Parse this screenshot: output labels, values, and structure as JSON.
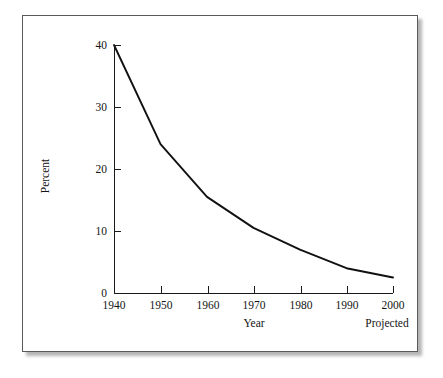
{
  "chart_data": {
    "type": "line",
    "title": "",
    "xlabel": "Year",
    "ylabel": "Percent",
    "x": [
      1940,
      1950,
      1960,
      1970,
      1980,
      1990,
      2000
    ],
    "values": [
      40,
      24,
      15.5,
      10.5,
      7,
      4,
      2.5
    ],
    "series": [
      {
        "name": "Percent",
        "values": [
          40,
          24,
          15.5,
          10.5,
          7,
          4,
          2.5
        ]
      }
    ],
    "xlim": [
      1940,
      2000
    ],
    "ylim": [
      0,
      40
    ],
    "x_ticks": [
      1940,
      1950,
      1960,
      1970,
      1980,
      1990,
      2000
    ],
    "x_tick_labels": [
      "1940",
      "1950",
      "1960",
      "1970",
      "1980",
      "1990",
      "2000"
    ],
    "y_ticks": [
      0,
      10,
      20,
      30,
      40
    ],
    "y_tick_labels": [
      "0",
      "10",
      "20",
      "30",
      "40"
    ],
    "grid": false,
    "legend": "none",
    "annotations": [
      {
        "text": "Projected",
        "x": 2000,
        "position": "below-last-x-tick"
      }
    ],
    "line_color": "#111111"
  },
  "figure": {
    "border_color": "#5a5a5a",
    "background": "#ffffff",
    "shadow_color": "#787878"
  }
}
